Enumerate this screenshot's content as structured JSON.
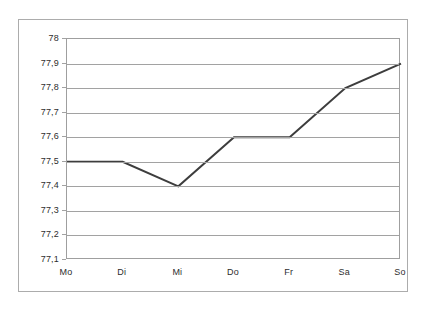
{
  "chart_data": {
    "type": "line",
    "title": "",
    "subtitle": "",
    "xlabel": "",
    "ylabel": "",
    "categories": [
      "Mo",
      "Di",
      "Mi",
      "Do",
      "Fr",
      "Sa",
      "So"
    ],
    "values": [
      77.5,
      77.5,
      77.4,
      77.6,
      77.6,
      77.8,
      77.9
    ],
    "value_labels": [
      "77,5",
      "77,5",
      "77,4",
      "77,6",
      "77,6",
      "77,8",
      "77,9"
    ],
    "series": [
      {
        "name": "",
        "values": [
          77.5,
          77.5,
          77.4,
          77.6,
          77.6,
          77.8,
          77.9
        ]
      }
    ],
    "ylim": [
      77.1,
      78.0
    ],
    "ytick_values": [
      78.0,
      77.9,
      77.8,
      77.7,
      77.6,
      77.5,
      77.4,
      77.3,
      77.2,
      77.1
    ],
    "ytick_labels": [
      "78",
      "77,9",
      "77,8",
      "77,7",
      "77,6",
      "77,5",
      "77,4",
      "77,3",
      "77,2",
      "77,1"
    ],
    "decimal_separator": ",",
    "grid": true,
    "grid_axis": "y",
    "legend": false,
    "legend_position": "none",
    "markers": false,
    "line_color": "#333333",
    "grid_color": "#9d9d9d",
    "axis_color": "#9a9a9a",
    "frame_color": "#a8a8a8",
    "background_color": "#ffffff",
    "text_color": "#1c1c1c"
  }
}
